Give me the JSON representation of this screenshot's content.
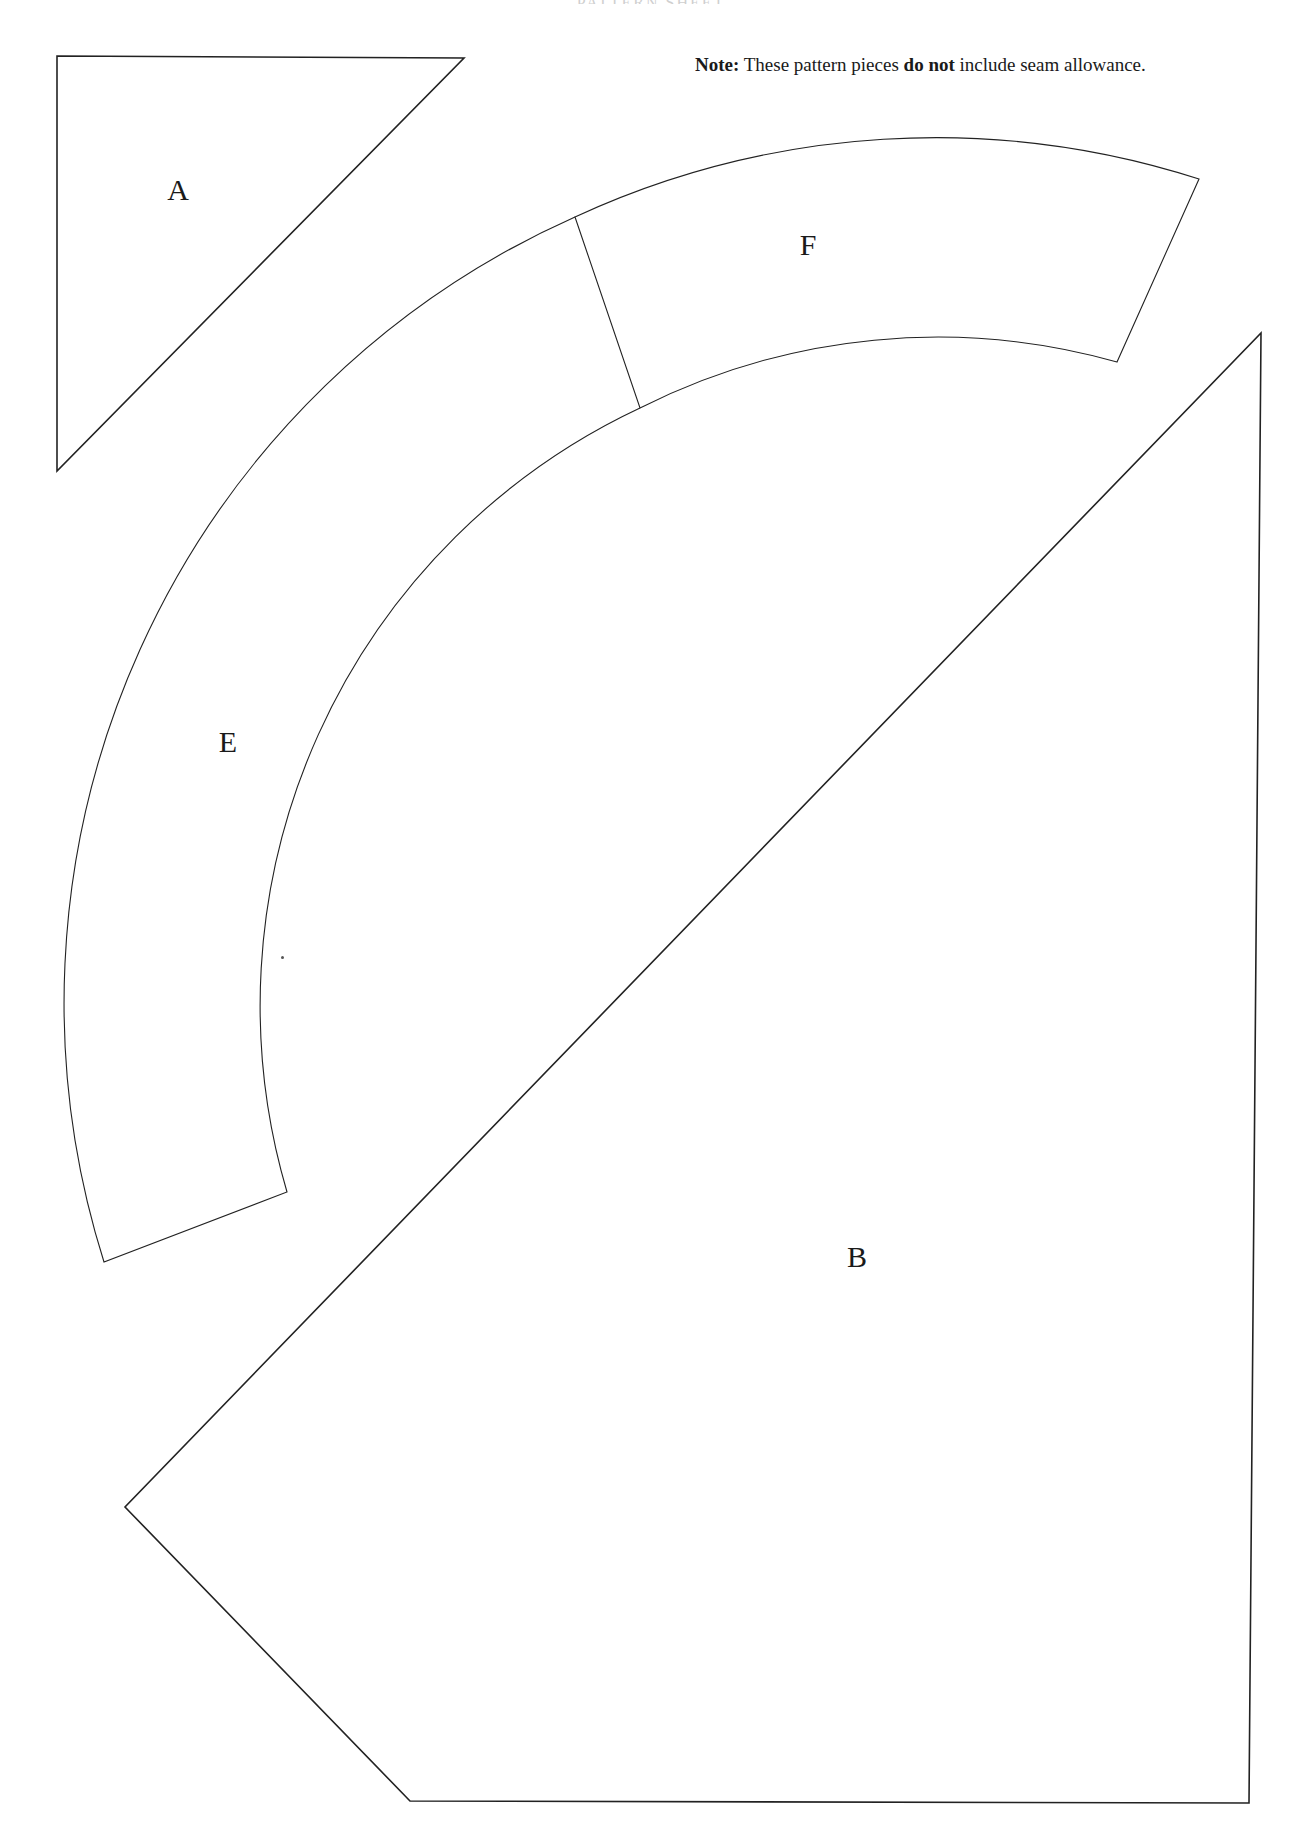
{
  "header": {
    "running_title": "PATTERN SHEET"
  },
  "note": {
    "prefix_bold": "Note:",
    "text_before": " These pattern pieces ",
    "emphasis_bold": "do not",
    "text_after": " include seam allowance."
  },
  "pieces": [
    {
      "label": "A",
      "shape": "right triangle"
    },
    {
      "label": "F",
      "shape": "curved band segment"
    },
    {
      "label": "E",
      "shape": "curved band segment"
    },
    {
      "label": "B",
      "shape": "pentagon"
    }
  ],
  "colors": {
    "line": "#222222",
    "background": "#ffffff",
    "text": "#1a1a1a"
  }
}
